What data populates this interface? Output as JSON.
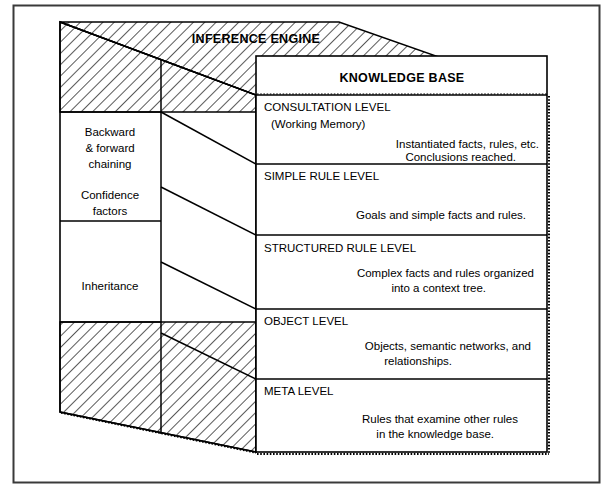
{
  "figure": {
    "kind": "3d-block-diagram",
    "outer_border_color": "#333333",
    "line_color": "#000000",
    "background_color": "#ffffff",
    "hatch_color": "#000000"
  },
  "top_face": {
    "label": "INFERENCE ENGINE"
  },
  "front_face": {
    "title": "KNOWLEDGE BASE",
    "levels": [
      {
        "id": "consultation-level",
        "heading": "CONSULTATION LEVEL",
        "subheading": "(Working Memory)",
        "body": [
          "Instantiated  facts,  rules,  etc.",
          "Conclusions  reached."
        ]
      },
      {
        "id": "simple-rule-level",
        "heading": "SIMPLE RULE LEVEL",
        "subheading": "",
        "body": [
          "Goals  and  simple  facts  and  rules."
        ]
      },
      {
        "id": "structured-rule-level",
        "heading": "STRUCTURED RULE LEVEL",
        "subheading": "",
        "body": [
          "Complex  facts  and  rules  organized",
          "into  a  context  tree."
        ]
      },
      {
        "id": "object-level",
        "heading": "OBJECT LEVEL",
        "subheading": "",
        "body": [
          "Objects,  semantic  networks,  and",
          "relationships."
        ]
      },
      {
        "id": "meta-level",
        "heading": "META LEVEL",
        "subheading": "",
        "body": [
          "Rules  that  examine  other  rules",
          "in  the  knowledge  base."
        ]
      }
    ]
  },
  "left_face": {
    "labels": [
      {
        "id": "backward-forward-chaining",
        "lines": [
          "Backward",
          "&  forward",
          "chaining"
        ]
      },
      {
        "id": "confidence-factors",
        "lines": [
          "Confidence",
          "factors"
        ]
      },
      {
        "id": "inheritance",
        "lines": [
          "Inheritance"
        ]
      }
    ]
  }
}
